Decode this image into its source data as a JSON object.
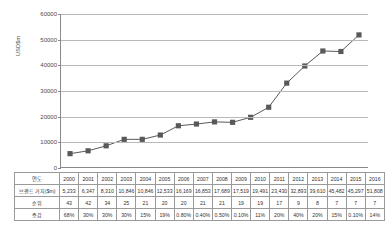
{
  "chart_data": {
    "type": "line",
    "title": "",
    "xlabel": "",
    "ylabel": "USD$m",
    "ylim": [
      0,
      60000
    ],
    "yticks": [
      0,
      10000,
      20000,
      30000,
      40000,
      50000,
      60000
    ],
    "ytick_labels": [
      "0",
      "10000",
      "20000",
      "30000",
      "40000",
      "50000",
      "60000"
    ],
    "grid": true,
    "legend": "none",
    "categories": [
      "2000",
      "2001",
      "2002",
      "2003",
      "2004",
      "2005",
      "2006",
      "2007",
      "2008",
      "2009",
      "2010",
      "2011",
      "2012",
      "2013",
      "2014",
      "2015",
      "2016"
    ],
    "series": [
      {
        "name": "브랜드 가치($m)",
        "marker": "square",
        "color": "#595959",
        "values": [
          5233,
          6347,
          8310,
          10846,
          10846,
          12533,
          16169,
          16853,
          17689,
          17519,
          19491,
          23430,
          32893,
          39610,
          45482,
          45297,
          51808
        ]
      }
    ]
  },
  "table": {
    "rows": [
      {
        "label": "연도",
        "values": [
          "2000",
          "2001",
          "2002",
          "2003",
          "2004",
          "2005",
          "2006",
          "2007",
          "2008",
          "2009",
          "2010",
          "2011",
          "2012",
          "2013",
          "2014",
          "2015",
          "2016"
        ]
      },
      {
        "label": "브랜드 가치($m)",
        "values": [
          "5,233",
          "6,347",
          "8,310",
          "10,846",
          "10,846",
          "12,533",
          "16,169",
          "16,853",
          "17,689",
          "17,519",
          "19,491",
          "23,430",
          "32,893",
          "39,610",
          "45,482",
          "45,297",
          "51,808"
        ]
      },
      {
        "label": "순위",
        "values": [
          "43",
          "42",
          "34",
          "25",
          "21",
          "20",
          "20",
          "21",
          "21",
          "19",
          "19",
          "17",
          "9",
          "8",
          "7",
          "7",
          "7"
        ]
      },
      {
        "label": "증감",
        "values": [
          "68%",
          "30%",
          "30%",
          "30%",
          "15%",
          "19%",
          "0.80%",
          "0.40%",
          "0.50%",
          "0.10%",
          "11%",
          "20%",
          "40%",
          "20%",
          "15%",
          "0.10%",
          "14%"
        ]
      }
    ]
  }
}
